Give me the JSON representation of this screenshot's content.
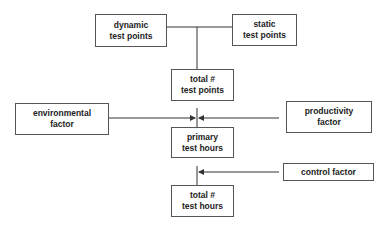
{
  "diagram": {
    "nodes": {
      "dynamic": {
        "line1": "dynamic",
        "line2": "test points"
      },
      "static": {
        "line1": "static",
        "line2": "test points"
      },
      "total_points": {
        "line1": "total #",
        "line2": "test points"
      },
      "environmental": {
        "line1": "environmental",
        "line2": "factor"
      },
      "productivity": {
        "line1": "productivity",
        "line2": "factor"
      },
      "primary": {
        "line1": "primary",
        "line2": "test hours"
      },
      "control": {
        "line1": "control factor"
      },
      "total_hours": {
        "line1": "total #",
        "line2": "test hours"
      }
    },
    "edges": [
      {
        "from": "dynamic",
        "to": "total_points"
      },
      {
        "from": "static",
        "to": "total_points"
      },
      {
        "from": "total_points",
        "to": "primary"
      },
      {
        "from": "environmental",
        "to": "primary",
        "arrow": true
      },
      {
        "from": "productivity",
        "to": "primary",
        "arrow": true
      },
      {
        "from": "primary",
        "to": "total_hours"
      },
      {
        "from": "control",
        "to": "total_hours",
        "arrow": true
      }
    ],
    "colors": {
      "line": "#333333",
      "border": "#555555",
      "text": "#222222"
    }
  }
}
